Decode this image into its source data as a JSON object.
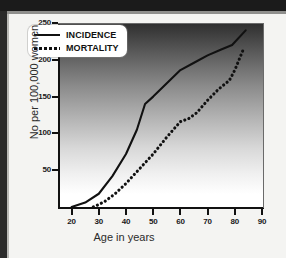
{
  "chart_data": {
    "type": "line",
    "title": "",
    "xlabel": "Age in years",
    "ylabel": "No per 100,000 women",
    "xlim": [
      15,
      90
    ],
    "ylim": [
      0,
      250
    ],
    "grid": false,
    "legend_position": "top-left",
    "xticks": [
      20,
      30,
      40,
      50,
      60,
      70,
      80,
      90
    ],
    "yticks": [
      50,
      100,
      150,
      200,
      250
    ],
    "series": [
      {
        "name": "INCIDENCE",
        "style": "solid",
        "color": "#111111",
        "points": [
          [
            20,
            0
          ],
          [
            25,
            6
          ],
          [
            30,
            18
          ],
          [
            35,
            42
          ],
          [
            40,
            72
          ],
          [
            44,
            105
          ],
          [
            47,
            140
          ],
          [
            50,
            150
          ],
          [
            55,
            168
          ],
          [
            60,
            186
          ],
          [
            65,
            196
          ],
          [
            70,
            206
          ],
          [
            75,
            214
          ],
          [
            79,
            220
          ],
          [
            84,
            240
          ]
        ]
      },
      {
        "name": "MORTALITY",
        "style": "dotted",
        "color": "#111111",
        "points": [
          [
            28,
            0
          ],
          [
            32,
            7
          ],
          [
            36,
            18
          ],
          [
            40,
            32
          ],
          [
            45,
            52
          ],
          [
            50,
            72
          ],
          [
            55,
            95
          ],
          [
            60,
            116
          ],
          [
            63,
            120
          ],
          [
            66,
            128
          ],
          [
            70,
            145
          ],
          [
            74,
            160
          ],
          [
            78,
            172
          ],
          [
            80,
            186
          ],
          [
            83,
            213
          ]
        ]
      }
    ]
  },
  "legend": {
    "items": [
      {
        "label": "INCIDENCE",
        "style": "solid"
      },
      {
        "label": "MORTALITY",
        "style": "dotted"
      }
    ]
  }
}
